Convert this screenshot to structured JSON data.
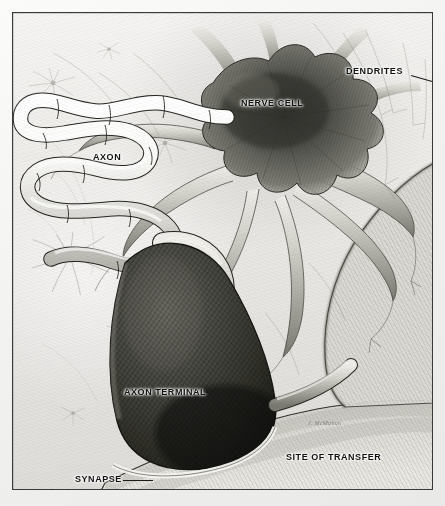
{
  "figure": {
    "kind": "scientific-illustration",
    "medium": "graphite-pencil-drawing",
    "frame_color": "#3a3a3a",
    "paper_color": "#eceae7",
    "ink_color": "#1b1b1b"
  },
  "labels": [
    {
      "id": "dendrites",
      "text": "DENDRITES",
      "x": 345,
      "y": 66,
      "leader": true
    },
    {
      "id": "nerve-cell",
      "text": "NERVE CELL",
      "x": 240,
      "y": 90,
      "leader": false
    },
    {
      "id": "axon",
      "text": "AXON",
      "x": 92,
      "y": 144,
      "leader": false
    },
    {
      "id": "axon-terminal",
      "text": "AXON TERMINAL",
      "x": 123,
      "y": 379,
      "leader": false
    },
    {
      "id": "site-of-transfer",
      "text": "SITE OF TRANSFER",
      "x": 285,
      "y": 444,
      "leader": false
    },
    {
      "id": "synapse",
      "text": "SYNAPSE",
      "x": 74,
      "y": 466,
      "leader": true
    }
  ],
  "signature": {
    "text": "J. McMahon",
    "x": 307,
    "y": 411
  },
  "structures": [
    {
      "name": "soma",
      "description": "Dark star-shaped nerve cell body, upper centre-right"
    },
    {
      "name": "dendrites",
      "description": "Many thick tapering branches radiating from the soma"
    },
    {
      "name": "myelinated-axon",
      "description": "Pale sinuous tube winding across the upper-left"
    },
    {
      "name": "axon-terminal",
      "description": "Large dark cross-hatched bulb at lower centre-left"
    },
    {
      "name": "synapse",
      "description": "Narrow pale cleft beneath the axon terminal"
    },
    {
      "name": "site-of-transfer",
      "description": "Broad hatched receiving surface filling the lower right"
    },
    {
      "name": "background-neurons",
      "description": "Faint small star-shaped neurons in the background field"
    }
  ]
}
